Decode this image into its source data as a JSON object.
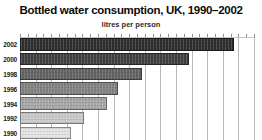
{
  "chart_data": {
    "type": "bar",
    "orientation": "horizontal",
    "title": "Bottled water consumption, UK, 1990–2002",
    "subtitle": "litres per person",
    "categories": [
      "2002",
      "2000",
      "1998",
      "1996",
      "1994",
      "1992",
      "1990"
    ],
    "values": [
      27.4,
      21.7,
      15.6,
      12.5,
      11.1,
      8.2,
      6.6
    ],
    "xlim": [
      0,
      30
    ],
    "gridline_interval": 2,
    "minor_tick_interval": 1,
    "grid": true,
    "x_axis_labels_visible": false,
    "bar_colors": [
      "#2e2e2e",
      "#404040",
      "#636363",
      "#828282",
      "#a6a6a6",
      "#c9c9c9",
      "#e3e3e3"
    ],
    "gridline_color": "#b8b8b8",
    "axis_color": "#8d8d8d",
    "background_color": "#ffffff",
    "title_color": "#0b0b0b"
  }
}
